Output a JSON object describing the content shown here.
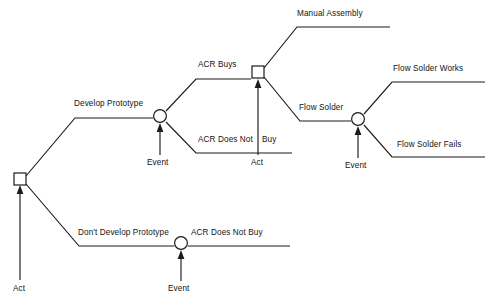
{
  "diagram": {
    "type": "decision-tree",
    "background_color": "#ffffff",
    "line_color": "#1b1b1b",
    "text_color": "#141414"
  },
  "nodes": [
    {
      "id": "root-act",
      "shape": "square",
      "kind": "decision",
      "annotation": "Act",
      "x": 20,
      "y": 179
    },
    {
      "id": "develop-event",
      "shape": "circle",
      "kind": "event",
      "annotation": "Event",
      "x": 160,
      "y": 116
    },
    {
      "id": "acr-buys-act",
      "shape": "square",
      "kind": "decision",
      "annotation": "Act",
      "x": 258,
      "y": 72
    },
    {
      "id": "flow-solder-event",
      "shape": "circle",
      "kind": "event",
      "annotation": "Event",
      "x": 358,
      "y": 119
    },
    {
      "id": "no-develop-event",
      "shape": "circle",
      "kind": "event",
      "annotation": "Event",
      "x": 181,
      "y": 243
    }
  ],
  "branch_labels": {
    "develop_prototype": "Develop Prototype",
    "dont_develop_prototype": "Don't Develop Prototype",
    "acr_buys": "ACR Buys",
    "acr_does_not_buy_left": "ACR Does Not",
    "acr_does_not_buy_right": "Buy",
    "acr_does_not_buy_bottom": "ACR Does Not Buy",
    "manual_assembly": "Manual Assembly",
    "flow_solder": "Flow Solder",
    "flow_solder_works": "Flow Solder Works",
    "flow_solder_fails": "Flow Solder Fails"
  },
  "annotations": {
    "act_root": "Act",
    "act_acr_buys": "Act",
    "event_develop": "Event",
    "event_flow_solder": "Event",
    "event_no_develop": "Event"
  }
}
